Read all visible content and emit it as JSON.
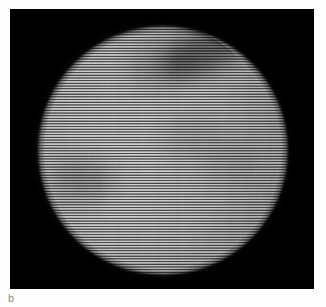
{
  "figure": {
    "panel_label": "b",
    "caption_color": "#8d8d8d",
    "background_color": "#fdfdfd",
    "panel_background_color": "#050505",
    "panel": {
      "x": 10,
      "y": 9,
      "width": 304,
      "height": 280
    },
    "disk": {
      "center_x": 153,
      "center_y": 141,
      "radius": 125,
      "core_brightness_hex": "#d8d8d8",
      "limb_brightness_hex": "#4a4a4a",
      "description": "bright circular disk with limb darkening"
    },
    "scanlines": {
      "orientation": "horizontal",
      "period_px": 2.7,
      "color_hex": "#000000",
      "description": "dark horizontal raster lines across the whole panel"
    },
    "surface_features": [
      {
        "name": "dark-band-upper-right",
        "x": 150,
        "y": 22,
        "width": 96,
        "height": 40,
        "rotation_deg": -22,
        "opacity": 0.45,
        "blur_px": 9,
        "color_hex": "#101010"
      },
      {
        "name": "dark-patch-upper-center",
        "x": 118,
        "y": 34,
        "width": 70,
        "height": 44,
        "rotation_deg": -12,
        "opacity": 0.22,
        "blur_px": 11,
        "color_hex": "#1a1a1a"
      },
      {
        "name": "dark-patch-left-mid",
        "x": 42,
        "y": 150,
        "width": 62,
        "height": 42,
        "rotation_deg": 14,
        "opacity": 0.26,
        "blur_px": 11,
        "color_hex": "#1c1c1c"
      },
      {
        "name": "dark-patch-center",
        "x": 150,
        "y": 108,
        "width": 58,
        "height": 40,
        "rotation_deg": 0,
        "opacity": 0.13,
        "blur_px": 12,
        "color_hex": "#202020"
      },
      {
        "name": "dark-patch-right-mid",
        "x": 196,
        "y": 128,
        "width": 54,
        "height": 46,
        "rotation_deg": 0,
        "opacity": 0.12,
        "blur_px": 12,
        "color_hex": "#202020"
      },
      {
        "name": "bright-patch-lower-left",
        "x": 56,
        "y": 176,
        "width": 80,
        "height": 58,
        "rotation_deg": 0,
        "opacity": 0.1,
        "blur_px": 13,
        "color_hex": "#ffffff"
      },
      {
        "name": "bright-patch-lower-center",
        "x": 118,
        "y": 190,
        "width": 86,
        "height": 52,
        "rotation_deg": 0,
        "opacity": 0.08,
        "blur_px": 13,
        "color_hex": "#ffffff"
      }
    ]
  }
}
